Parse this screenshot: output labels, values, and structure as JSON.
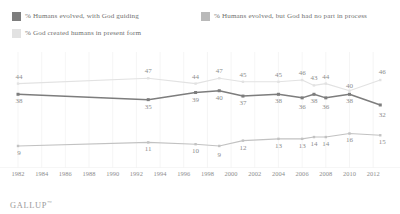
{
  "legend": {
    "items": [
      {
        "label": "% Humans evolved, with God guiding",
        "color": "#7d7d7d",
        "swatch_name": "legend-swatch-evolved-with-god"
      },
      {
        "label": "% Humans evolved, but God had no part in process",
        "color": "#b9b9b9",
        "swatch_name": "legend-swatch-evolved-no-god"
      },
      {
        "label": "% God created humans in present form",
        "color": "#e2e2e2",
        "swatch_name": "legend-swatch-created-present-form"
      }
    ]
  },
  "footer": {
    "brand": "GALLUP",
    "trademark": "™"
  },
  "chart_data": {
    "type": "line",
    "title": "",
    "subtitle": "",
    "xlabel": "",
    "ylabel": "",
    "ylim": [
      0,
      55
    ],
    "grid": true,
    "grid_orientation": "vertical",
    "legend_position": "top",
    "x_tick_labels": [
      "1982",
      "1984",
      "1986",
      "1988",
      "1990",
      "1992",
      "1994",
      "1996",
      "1998",
      "2000",
      "2002",
      "2004",
      "2006",
      "2008",
      "2010",
      "2012"
    ],
    "x": [
      1982,
      1993,
      1997,
      1999,
      2001,
      2004,
      2006,
      2007,
      2008,
      2010,
      2012.6
    ],
    "series": [
      {
        "name": "% God created humans in present form",
        "color": "#e2e2e2",
        "values": [
          44,
          47,
          44,
          47,
          45,
          45,
          46,
          43,
          44,
          40,
          46
        ],
        "labels": [
          "44",
          "47",
          "44",
          "47",
          "45",
          "45",
          "46",
          "43",
          "44",
          "40",
          "46"
        ]
      },
      {
        "name": "% Humans evolved, with God guiding",
        "color": "#7d7d7d",
        "values": [
          38,
          35,
          39,
          40,
          37,
          38,
          36,
          38,
          36,
          38,
          32
        ],
        "labels": [
          "38",
          "35",
          "39",
          "40",
          "37",
          "38",
          "36",
          "38",
          "36",
          "38",
          "32"
        ]
      },
      {
        "name": "% Humans evolved, but God had no part in process",
        "color": "#c2c2c2",
        "values": [
          9,
          11,
          10,
          9,
          12,
          13,
          13,
          14,
          14,
          16,
          15
        ],
        "labels": [
          "9",
          "11",
          "10",
          "9",
          "12",
          "13",
          "13",
          "14",
          "14",
          "16",
          "15"
        ]
      }
    ]
  }
}
